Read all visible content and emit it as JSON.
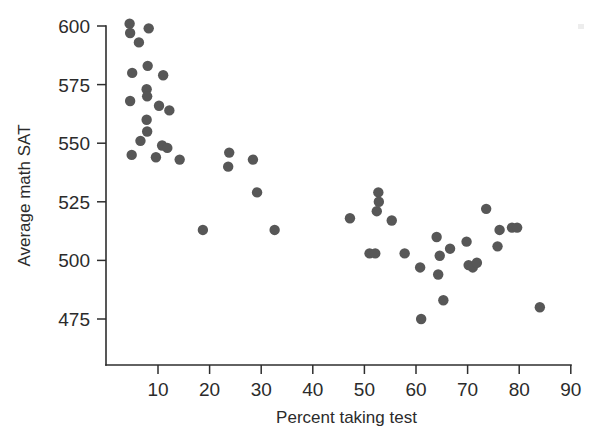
{
  "chart_data": {
    "type": "scatter",
    "title": "",
    "xlabel": "Percent taking test",
    "ylabel": "Average math SAT",
    "xlim": [
      0,
      90
    ],
    "ylim": [
      465,
      607
    ],
    "grid": false,
    "legend": null,
    "marker": {
      "shape": "circle",
      "color": "#575757",
      "radius_px": 5.2
    },
    "xticks": [
      10,
      20,
      30,
      40,
      50,
      60,
      70,
      80,
      90
    ],
    "yticks": [
      475,
      500,
      525,
      550,
      575,
      600
    ],
    "xtick_labels": [
      "10",
      "20",
      "30",
      "40",
      "50",
      "60",
      "70",
      "80",
      "90"
    ],
    "ytick_labels": [
      "475",
      "500",
      "525",
      "550",
      "575",
      "600"
    ],
    "n_points": 51,
    "points": [
      {
        "x": 4.5,
        "y": 601
      },
      {
        "x": 4.6,
        "y": 597
      },
      {
        "x": 8.2,
        "y": 599
      },
      {
        "x": 6.3,
        "y": 593
      },
      {
        "x": 8.0,
        "y": 583
      },
      {
        "x": 5.0,
        "y": 580
      },
      {
        "x": 11.0,
        "y": 579
      },
      {
        "x": 4.6,
        "y": 568
      },
      {
        "x": 7.8,
        "y": 573
      },
      {
        "x": 7.9,
        "y": 570
      },
      {
        "x": 10.2,
        "y": 566
      },
      {
        "x": 12.2,
        "y": 564
      },
      {
        "x": 7.8,
        "y": 560
      },
      {
        "x": 7.9,
        "y": 555
      },
      {
        "x": 6.6,
        "y": 551
      },
      {
        "x": 10.8,
        "y": 549
      },
      {
        "x": 11.8,
        "y": 548
      },
      {
        "x": 4.9,
        "y": 545
      },
      {
        "x": 9.6,
        "y": 544
      },
      {
        "x": 14.2,
        "y": 543
      },
      {
        "x": 18.7,
        "y": 513
      },
      {
        "x": 23.8,
        "y": 546
      },
      {
        "x": 23.6,
        "y": 540
      },
      {
        "x": 28.4,
        "y": 543
      },
      {
        "x": 29.2,
        "y": 529
      },
      {
        "x": 32.6,
        "y": 513
      },
      {
        "x": 47.2,
        "y": 518
      },
      {
        "x": 52.7,
        "y": 529
      },
      {
        "x": 52.8,
        "y": 525
      },
      {
        "x": 52.4,
        "y": 521
      },
      {
        "x": 55.3,
        "y": 517
      },
      {
        "x": 51.0,
        "y": 503
      },
      {
        "x": 52.1,
        "y": 503
      },
      {
        "x": 57.8,
        "y": 503
      },
      {
        "x": 60.8,
        "y": 497
      },
      {
        "x": 64.0,
        "y": 510
      },
      {
        "x": 64.6,
        "y": 502
      },
      {
        "x": 66.6,
        "y": 505
      },
      {
        "x": 69.8,
        "y": 508
      },
      {
        "x": 70.2,
        "y": 498
      },
      {
        "x": 71.0,
        "y": 497
      },
      {
        "x": 71.8,
        "y": 499
      },
      {
        "x": 73.6,
        "y": 522
      },
      {
        "x": 76.2,
        "y": 513
      },
      {
        "x": 75.8,
        "y": 506
      },
      {
        "x": 78.6,
        "y": 514
      },
      {
        "x": 79.6,
        "y": 514
      },
      {
        "x": 64.3,
        "y": 494
      },
      {
        "x": 65.3,
        "y": 483
      },
      {
        "x": 61.0,
        "y": 475
      },
      {
        "x": 84.0,
        "y": 480
      }
    ]
  }
}
